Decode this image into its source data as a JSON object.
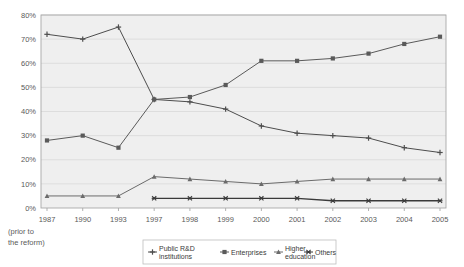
{
  "chart_data": {
    "type": "line",
    "title": "",
    "subtitle": "",
    "xlabel": "",
    "ylabel": "",
    "xnote_line1": "(prior to",
    "xnote_line2": "the reform)",
    "categories": [
      "1987",
      "1990",
      "1993",
      "1997",
      "1998",
      "1999",
      "2000",
      "2001",
      "2002",
      "2003",
      "2004",
      "2005"
    ],
    "ytick_labels": [
      "0%",
      "10%",
      "20%",
      "30%",
      "40%",
      "50%",
      "60%",
      "70%",
      "80%"
    ],
    "ytick_values": [
      0,
      10,
      20,
      30,
      40,
      50,
      60,
      70,
      80
    ],
    "ylim": [
      0,
      80
    ],
    "grid": true,
    "legend_position": "bottom",
    "series": [
      {
        "name": "Public R&D institutions",
        "marker": "plus",
        "color": "#4d4d4d",
        "values": [
          72,
          70,
          75,
          45,
          44,
          41,
          34,
          31,
          30,
          29,
          25,
          23
        ]
      },
      {
        "name": "Enterprises",
        "marker": "square",
        "color": "#5a5a5a",
        "values": [
          28,
          30,
          25,
          45,
          46,
          51,
          61,
          61,
          62,
          64,
          68,
          71
        ]
      },
      {
        "name": "Higher education",
        "marker": "triangle",
        "color": "#6b6b6b",
        "values": [
          5,
          5,
          5,
          13,
          12,
          11,
          10,
          11,
          12,
          12,
          12,
          12
        ]
      },
      {
        "name": "Others",
        "marker": "cross",
        "color": "#3a3a3a",
        "values": [
          null,
          null,
          null,
          4,
          4,
          4,
          4,
          4,
          3,
          3,
          3,
          3
        ]
      }
    ]
  },
  "legend": {
    "items": [
      {
        "label_line1": "Public R&D",
        "label_line2": "institutions"
      },
      {
        "label_line1": "Enterprises",
        "label_line2": ""
      },
      {
        "label_line1": "Higher",
        "label_line2": "education"
      },
      {
        "label_line1": "Others",
        "label_line2": ""
      }
    ]
  },
  "style": {
    "plot_background": "#efefef",
    "grid_color": "#d8d8d8",
    "axis_color": "#a8a8a8",
    "page_background": "#ffffff"
  }
}
